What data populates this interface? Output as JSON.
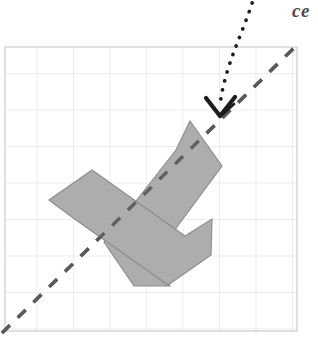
{
  "figure": {
    "type": "geometry-reflection-diagram",
    "canvas": {
      "width": 318,
      "height": 340,
      "background": "#ffffff"
    },
    "annotation": {
      "label_text": "ce",
      "label_note": "italic serif caption cropped at top-right edge of image",
      "x": 292,
      "y": 1,
      "color": "#4a4a4a"
    },
    "grid": {
      "x": 5,
      "y": 47,
      "width": 292,
      "height": 284,
      "cell_size": 36.5,
      "columns": 8,
      "rows": 8,
      "line_color": "#dcdcdc",
      "border_color": "#d0d0d0",
      "visible": true
    },
    "mirror_line": {
      "name": "line-of-symmetry",
      "style": "dashed",
      "x1": 2,
      "y1": 333,
      "x2": 297,
      "y2": 45,
      "color": "#5a5a5a",
      "stroke_width": 3.4,
      "dash_pattern": "11 11"
    },
    "pointer": {
      "name": "dotted-curved-arrow",
      "style": "dotted",
      "color": "#1c1c1c",
      "stroke_width": 3.6,
      "dot_spacing": "0.2 9",
      "path": "M 255 -6 C 243 34 226 62 220 104",
      "arrow_tip_x": 220,
      "arrow_tip_y": 116,
      "arrow_head": "chevron-down"
    },
    "shapes": [
      {
        "name": "original-l-shape",
        "fill": "#adadad",
        "stroke": "#8e8e8e",
        "stroke_width": 1.2,
        "opacity": 1,
        "points": "190,121 222,166 154,258 170,286 134,286 104,242 176,150"
      },
      {
        "name": "reflected-l-shape",
        "fill": "#adadad",
        "stroke": "#8e8e8e",
        "stroke_width": 1.2,
        "opacity": 1,
        "points": "49,200 92,170 185,236 212,219 211,255 168,285 76,220"
      }
    ],
    "shape_outline": {
      "name": "combined-shape-outline",
      "stroke": "#8e8e8e",
      "stroke_width": 1.3,
      "fill": "none"
    }
  }
}
